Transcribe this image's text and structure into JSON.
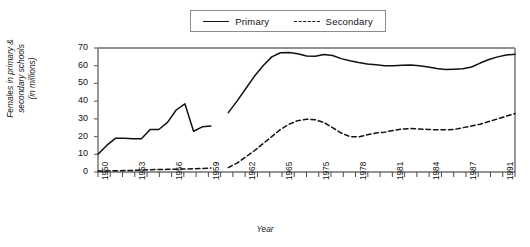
{
  "chart_data": {
    "type": "line",
    "title": "",
    "xlabel": "Year",
    "ylabel": "Females in primary & secondary schools (in millions)",
    "ylabel_line1": "Females in primary &",
    "ylabel_line2": "secondary schools",
    "ylabel_line3": "(in millions)",
    "ylim": [
      0,
      70
    ],
    "ytick_values": [
      0,
      10,
      20,
      30,
      40,
      50,
      60,
      70
    ],
    "ytick_labels": [
      "0",
      "10",
      "20",
      "30",
      "40",
      "50",
      "60",
      "70"
    ],
    "grid": false,
    "legend_position": "top-center",
    "legend": [
      {
        "name": "Primary",
        "style": "solid"
      },
      {
        "name": "Secondary",
        "style": "dashed"
      }
    ],
    "x_labeled_ticks": [
      "1950",
      "1953",
      "1956",
      "1959",
      "1962",
      "1965",
      "1975",
      "1978",
      "1981",
      "1984",
      "1987",
      "1991",
      "1994",
      "1997"
    ],
    "x_tick_count": 35,
    "note": "Data series are discontinuous: an early block and a later block separated by a gap.",
    "series": [
      {
        "name": "Primary",
        "style": "solid",
        "segments": [
          {
            "x": [
              1950,
              1951,
              1952,
              1953,
              1954,
              1955,
              1956,
              1957,
              1958,
              1959,
              1960,
              1961,
              1962,
              1963
            ],
            "values": [
              10,
              15,
              19,
              19,
              18.8,
              18.8,
              24,
              24,
              28,
              35,
              38.5,
              23,
              25.5,
              26
            ]
          },
          {
            "x": [
              1965,
              1966,
              1967,
              1968,
              1969,
              1970,
              1971,
              1972,
              1973,
              1974,
              1975,
              1976,
              1977,
              1978,
              1979,
              1980,
              1981,
              1982,
              1983,
              1984,
              1985,
              1986,
              1987,
              1988,
              1989,
              1990,
              1991,
              1992,
              1993,
              1994,
              1995,
              1996,
              1997,
              1998
            ],
            "values": [
              33.5,
              40,
              47,
              54,
              60,
              65,
              67.3,
              67.5,
              66.8,
              65.5,
              65.3,
              66.3,
              65.8,
              64,
              62.8,
              61.8,
              61,
              60.5,
              60,
              60,
              60.3,
              60.4,
              60,
              59.3,
              58.4,
              57.8,
              58,
              58.3,
              59.3,
              61.5,
              63.5,
              65,
              66,
              66.5
            ]
          }
        ]
      },
      {
        "name": "Secondary",
        "style": "dashed",
        "segments": [
          {
            "x": [
              1950,
              1951,
              1952,
              1953,
              1954,
              1955,
              1956,
              1957,
              1958,
              1959,
              1960,
              1961,
              1962,
              1963
            ],
            "values": [
              0.6,
              0.6,
              0.7,
              0.8,
              0.9,
              1.1,
              1.3,
              1.4,
              1.5,
              1.6,
              1.7,
              1.8,
              2.0,
              2.2
            ]
          },
          {
            "x": [
              1965,
              1966,
              1967,
              1968,
              1969,
              1970,
              1971,
              1972,
              1973,
              1974,
              1975,
              1976,
              1977,
              1978,
              1979,
              1980,
              1981,
              1982,
              1983,
              1984,
              1985,
              1986,
              1987,
              1988,
              1989,
              1990,
              1991,
              1992,
              1993,
              1994,
              1995,
              1996,
              1997,
              1998
            ],
            "values": [
              2.5,
              5,
              8.5,
              12,
              16,
              20,
              24,
              27,
              29,
              29.8,
              29.5,
              28,
              25,
              22,
              20,
              19.8,
              21,
              22,
              22.5,
              23.5,
              24.3,
              24.5,
              24.3,
              24,
              23.8,
              23.8,
              24,
              25,
              26,
              27,
              28.5,
              30,
              31.5,
              33
            ]
          }
        ]
      }
    ]
  },
  "colors": {
    "line": "#111111",
    "frame": "#6e6e6e",
    "legend_border": "#8c8c8c",
    "background": "#ffffff"
  }
}
